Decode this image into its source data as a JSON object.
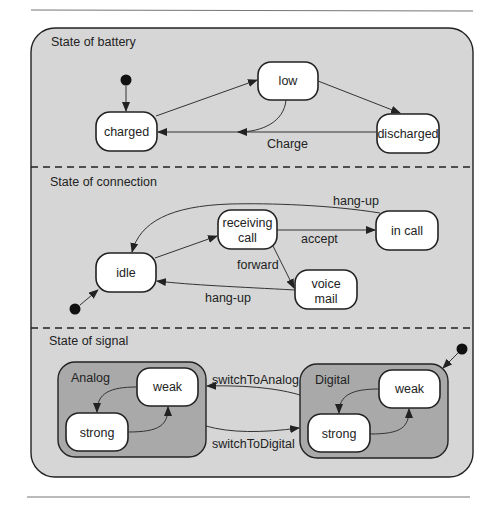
{
  "colors": {
    "outer_fill": "#d6d6d6",
    "composite_fill": "#a9a9a9",
    "node_fill": "#ffffff",
    "stroke": "#222222"
  },
  "regions": {
    "battery": {
      "title": "State of battery",
      "states": {
        "charged": "charged",
        "low": "low",
        "discharged": "discharged"
      },
      "transitions": {
        "charge": "Charge"
      }
    },
    "connection": {
      "title": "State of connection",
      "states": {
        "idle": "idle",
        "receiving_1": "receiving",
        "receiving_2": "call",
        "in_call": "in call",
        "voice_1": "voice",
        "voice_2": "mail"
      },
      "transitions": {
        "hang_up_top": "hang-up",
        "accept": "accept",
        "forward": "forward",
        "hang_up_bottom": "hang-up"
      }
    },
    "signal": {
      "title": "State of signal",
      "analog": {
        "title": "Analog",
        "weak": "weak",
        "strong": "strong"
      },
      "digital": {
        "title": "Digital",
        "weak": "weak",
        "strong": "strong"
      },
      "transitions": {
        "to_analog": "switchToAnalog",
        "to_digital": "switchToDigital"
      }
    }
  }
}
